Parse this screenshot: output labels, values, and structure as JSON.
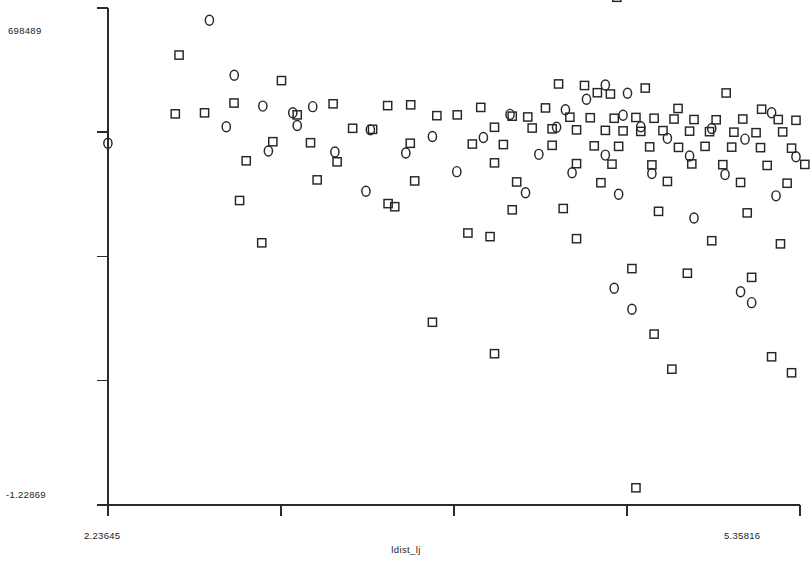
{
  "axes": {
    "y_max_label": "698489",
    "y_min_label": "-1.22869",
    "x_min_label": "2.23645",
    "x_max_label": "5.35816",
    "x_title": "ldist_lj"
  },
  "chart_data": {
    "type": "scatter",
    "title": "",
    "xlabel": "ldist_lj",
    "ylabel": "",
    "xlim": [
      2.23645,
      5.35816
    ],
    "ylim": [
      -1.22869,
      0.698489
    ],
    "grid": false,
    "legend": null,
    "x_ticks": [
      2.23645,
      3.01688,
      3.79731,
      4.57773,
      5.35816
    ],
    "y_ticks": [
      -1.22869,
      -0.746545,
      -0.264403,
      0.217739,
      0.698489
    ],
    "marker_colors": {
      "stroke": "#262626",
      "fill": "none"
    },
    "series": [
      {
        "name": "squares",
        "marker": "square",
        "points": [
          [
            2.557,
            0.516
          ],
          [
            4.532,
            0.74
          ],
          [
            3.019,
            0.417
          ],
          [
            4.269,
            0.404
          ],
          [
            4.386,
            0.398
          ],
          [
            4.66,
            0.388
          ],
          [
            4.444,
            0.37
          ],
          [
            4.503,
            0.365
          ],
          [
            5.025,
            0.369
          ],
          [
            2.805,
            0.33
          ],
          [
            3.252,
            0.327
          ],
          [
            3.498,
            0.32
          ],
          [
            3.602,
            0.323
          ],
          [
            3.918,
            0.313
          ],
          [
            4.21,
            0.311
          ],
          [
            4.808,
            0.309
          ],
          [
            5.185,
            0.306
          ],
          [
            5.46,
            0.309
          ],
          [
            5.653,
            0.313
          ],
          [
            2.54,
            0.288
          ],
          [
            2.672,
            0.292
          ],
          [
            3.09,
            0.284
          ],
          [
            3.72,
            0.281
          ],
          [
            3.812,
            0.284
          ],
          [
            4.06,
            0.279
          ],
          [
            4.13,
            0.276
          ],
          [
            4.32,
            0.275
          ],
          [
            4.412,
            0.273
          ],
          [
            4.52,
            0.271
          ],
          [
            4.618,
            0.274
          ],
          [
            4.7,
            0.271
          ],
          [
            4.79,
            0.268
          ],
          [
            4.88,
            0.266
          ],
          [
            4.98,
            0.265
          ],
          [
            5.1,
            0.268
          ],
          [
            5.26,
            0.266
          ],
          [
            5.34,
            0.263
          ],
          [
            5.52,
            0.264
          ],
          [
            5.6,
            0.262
          ],
          [
            3.34,
            0.232
          ],
          [
            3.43,
            0.228
          ],
          [
            3.98,
            0.236
          ],
          [
            4.15,
            0.233
          ],
          [
            4.24,
            0.23
          ],
          [
            4.35,
            0.226
          ],
          [
            4.48,
            0.224
          ],
          [
            4.56,
            0.222
          ],
          [
            4.64,
            0.22
          ],
          [
            4.74,
            0.223
          ],
          [
            4.86,
            0.221
          ],
          [
            4.95,
            0.219
          ],
          [
            5.06,
            0.217
          ],
          [
            5.16,
            0.215
          ],
          [
            5.28,
            0.218
          ],
          [
            5.4,
            0.216
          ],
          [
            5.56,
            0.213
          ],
          [
            2.98,
            0.18
          ],
          [
            3.15,
            0.176
          ],
          [
            3.6,
            0.174
          ],
          [
            3.88,
            0.171
          ],
          [
            4.02,
            0.169
          ],
          [
            4.24,
            0.166
          ],
          [
            4.43,
            0.164
          ],
          [
            4.54,
            0.162
          ],
          [
            4.68,
            0.16
          ],
          [
            4.81,
            0.158
          ],
          [
            4.93,
            0.162
          ],
          [
            5.05,
            0.159
          ],
          [
            5.18,
            0.157
          ],
          [
            5.32,
            0.155
          ],
          [
            5.45,
            0.159
          ],
          [
            5.58,
            0.156
          ],
          [
            2.86,
            0.106
          ],
          [
            3.27,
            0.102
          ],
          [
            3.98,
            0.098
          ],
          [
            4.35,
            0.095
          ],
          [
            4.51,
            0.093
          ],
          [
            4.69,
            0.09
          ],
          [
            4.87,
            0.094
          ],
          [
            5.01,
            0.091
          ],
          [
            5.21,
            0.088
          ],
          [
            5.38,
            0.092
          ],
          [
            5.54,
            0.089
          ],
          [
            3.18,
            0.032
          ],
          [
            3.62,
            0.028
          ],
          [
            4.08,
            0.024
          ],
          [
            4.46,
            0.021
          ],
          [
            4.76,
            0.026
          ],
          [
            5.09,
            0.022
          ],
          [
            5.3,
            0.019
          ],
          [
            5.49,
            0.023
          ],
          [
            2.83,
            -0.048
          ],
          [
            3.5,
            -0.06
          ],
          [
            3.53,
            -0.072
          ],
          [
            4.06,
            -0.084
          ],
          [
            4.29,
            -0.079
          ],
          [
            4.72,
            -0.09
          ],
          [
            5.12,
            -0.096
          ],
          [
            5.42,
            -0.101
          ],
          [
            5.62,
            -0.112
          ],
          [
            2.93,
            -0.212
          ],
          [
            3.86,
            -0.174
          ],
          [
            3.96,
            -0.188
          ],
          [
            4.35,
            -0.196
          ],
          [
            4.96,
            -0.204
          ],
          [
            5.27,
            -0.216
          ],
          [
            4.6,
            -0.312
          ],
          [
            4.85,
            -0.33
          ],
          [
            5.14,
            -0.346
          ],
          [
            3.7,
            -0.52
          ],
          [
            4.7,
            -0.566
          ],
          [
            3.98,
            -0.642
          ],
          [
            5.23,
            -0.654
          ],
          [
            4.78,
            -0.702
          ],
          [
            5.32,
            -0.716
          ],
          [
            4.618,
            -1.162
          ]
        ]
      },
      {
        "name": "circles",
        "marker": "circle",
        "points": [
          [
            2.694,
            0.651
          ],
          [
            2.806,
            0.438
          ],
          [
            4.48,
            0.4
          ],
          [
            4.58,
            0.368
          ],
          [
            2.935,
            0.318
          ],
          [
            3.16,
            0.316
          ],
          [
            3.07,
            0.292
          ],
          [
            4.395,
            0.345
          ],
          [
            4.3,
            0.304
          ],
          [
            5.23,
            0.292
          ],
          [
            5.64,
            0.296
          ],
          [
            2.236,
            0.174
          ],
          [
            2.77,
            0.238
          ],
          [
            3.09,
            0.243
          ],
          [
            3.42,
            0.226
          ],
          [
            4.05,
            0.286
          ],
          [
            4.56,
            0.283
          ],
          [
            4.26,
            0.236
          ],
          [
            4.64,
            0.238
          ],
          [
            4.96,
            0.231
          ],
          [
            5.43,
            0.226
          ],
          [
            3.7,
            0.2
          ],
          [
            3.93,
            0.196
          ],
          [
            4.76,
            0.193
          ],
          [
            5.11,
            0.19
          ],
          [
            2.96,
            0.144
          ],
          [
            3.26,
            0.14
          ],
          [
            3.58,
            0.136
          ],
          [
            4.18,
            0.131
          ],
          [
            4.48,
            0.128
          ],
          [
            4.86,
            0.125
          ],
          [
            5.34,
            0.122
          ],
          [
            3.81,
            0.064
          ],
          [
            4.33,
            0.06
          ],
          [
            4.69,
            0.057
          ],
          [
            5.02,
            0.053
          ],
          [
            5.5,
            0.05
          ],
          [
            3.4,
            -0.012
          ],
          [
            4.12,
            -0.018
          ],
          [
            4.54,
            -0.024
          ],
          [
            5.25,
            -0.03
          ],
          [
            4.88,
            -0.116
          ],
          [
            5.58,
            -0.124
          ],
          [
            4.52,
            -0.388
          ],
          [
            4.6,
            -0.47
          ],
          [
            5.09,
            -0.402
          ],
          [
            5.14,
            -0.444
          ],
          [
            5.47,
            -0.592
          ],
          [
            5.4,
            -0.838
          ]
        ]
      }
    ]
  }
}
